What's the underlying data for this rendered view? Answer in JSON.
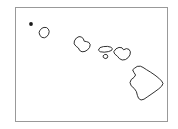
{
  "figure": {
    "kind": "outline-map",
    "background_color": "#ffffff",
    "frame": {
      "visible": true,
      "color": "#999999",
      "x": 15,
      "y": 7,
      "width": 153,
      "height": 115
    },
    "outline_color": "#1a1a1a",
    "fill_color": "#ffffff",
    "stroke_width": 0.9,
    "labels_visible": false,
    "legend_visible": false,
    "title": "",
    "caption": ""
  },
  "map_data": {
    "type": "outline",
    "projection": "none",
    "region": "Hawaii",
    "feature_count": 7,
    "features": [
      {
        "name": "Niihau",
        "shape": "dot",
        "center": [
          31,
          24
        ],
        "radius": 1.9,
        "path": ""
      },
      {
        "name": "Kauai",
        "shape": "polygon",
        "center": [
          43.5,
          32.5
        ],
        "path": "M 40.0 30.4 L 41.6 28.4 L 44.0 27.4 L 46.6 27.6 L 48.4 29.2 L 49.2 31.4 L 48.6 34.2 L 46.8 36.6 L 44.4 37.8 L 42.0 37.4 L 40.0 35.6 L 39.2 33.0 Z"
      },
      {
        "name": "Oahu",
        "shape": "polygon",
        "center": [
          82,
          44
        ],
        "path": "M 74.6 40.6 L 76.4 38.0 L 79.0 36.6 L 81.6 37.0 L 83.4 39.0 L 84.2 41.2 L 86.4 41.6 L 88.8 42.4 L 90.2 44.6 L 89.6 47.4 L 87.6 49.8 L 85.0 51.4 L 82.0 51.8 L 79.6 50.4 L 78.4 48.0 L 76.2 46.4 L 74.4 44.2 Z"
      },
      {
        "name": "Molokai",
        "shape": "polygon",
        "center": [
          105,
          49
        ],
        "path": "M 98.6 49.8 L 100.0 47.6 L 103.4 46.6 L 107.6 46.4 L 110.8 47.2 L 112.4 48.6 L 111.6 50.4 L 108.4 51.6 L 104.2 52.2 L 100.6 51.8 Z"
      },
      {
        "name": "Lanai",
        "shape": "polygon",
        "center": [
          105.6,
          56.4
        ],
        "path": "M 103.4 55.6 L 104.8 54.4 L 106.8 54.6 L 107.8 56.2 L 107.2 58.0 L 105.2 58.6 L 103.6 57.6 Z"
      },
      {
        "name": "Maui",
        "shape": "polygon",
        "center": [
          122,
          53
        ],
        "path": "M 114.0 51.4 L 116.0 48.8 L 119.0 47.4 L 122.0 47.8 L 123.6 49.8 L 126.4 48.6 L 129.0 49.4 L 130.4 51.8 L 130.0 54.8 L 128.2 57.6 L 125.4 59.6 L 122.2 60.0 L 119.4 58.6 L 117.4 56.2 L 115.0 54.2 Z"
      },
      {
        "name": "Hawaii (Big Island)",
        "shape": "polygon",
        "center": [
          146,
          83
        ],
        "path": "M 134.6 68.2 L 137.2 66.4 L 140.4 66.2 L 143.0 67.4 L 146.4 69.6 L 150.6 72.2 L 155.0 75.2 L 158.8 78.2 L 161.6 81.0 L 163.0 83.4 L 161.8 86.0 L 158.8 88.8 L 155.0 91.6 L 151.0 94.4 L 147.2 97.0 L 144.0 99.2 L 141.0 100.0 L 138.6 98.4 L 137.4 95.4 L 136.4 91.6 L 134.2 88.4 L 131.2 85.8 L 130.0 82.6 L 131.2 79.6 L 134.0 77.4 L 135.6 75.0 L 134.0 72.6 L 132.8 70.2 Z"
      }
    ]
  }
}
